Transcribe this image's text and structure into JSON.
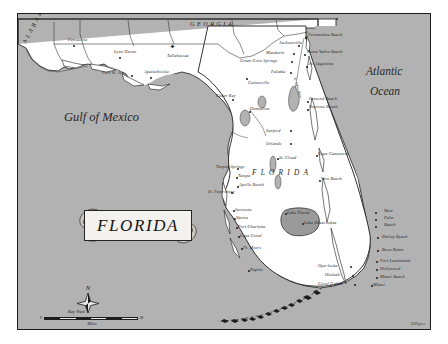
{
  "map": {
    "title": "FLORIDA",
    "frame": {
      "sea_color": "#b2b2b2",
      "land_color": "#ffffff",
      "ink_color": "#1b1b1b",
      "lake_color": "#9a9a9a"
    },
    "water_bodies": [
      {
        "name": "Gulf of Mexico",
        "x": 46,
        "y": 103
      },
      {
        "name": "Atlantic",
        "x": 348,
        "y": 58
      },
      {
        "name": "Ocean",
        "x": 352,
        "y": 78
      }
    ],
    "states": [
      {
        "name": "ALABAMA",
        "x": 13,
        "y": 22,
        "rotate": -62
      },
      {
        "name": "GEORGIA",
        "x": 172,
        "y": 7,
        "rotate": 0
      },
      {
        "name": "FLORIDA",
        "x": 236,
        "y": 157,
        "rotate": 0
      }
    ],
    "capital": {
      "name": "Tallahassee",
      "x": 154,
      "y": 38,
      "symbol": "star"
    },
    "river_label": {
      "name": "St. Johns River",
      "x": 298,
      "y": 73
    },
    "keys_label": {
      "name": "Key West",
      "x": 253,
      "y": 299
    },
    "credit": "DDFigures",
    "cities": [
      {
        "name": "Pensacola",
        "lx": 50,
        "ly": 24,
        "dx": 55,
        "dy": 31,
        "align": "left"
      },
      {
        "name": "Lynn Haven",
        "lx": 96,
        "ly": 36,
        "dx": 101,
        "dy": 43,
        "align": "left"
      },
      {
        "name": "Port St. Joe",
        "lx": 84,
        "ly": 57,
        "dx": 113,
        "dy": 61,
        "align": "left"
      },
      {
        "name": "Apalachicola",
        "lx": 126,
        "ly": 56,
        "dx": 132,
        "dy": 63,
        "align": "left"
      },
      {
        "name": "Cedar Key",
        "lx": 198,
        "ly": 80,
        "dx": 214,
        "dy": 85,
        "align": "left"
      },
      {
        "name": "Dunnellon",
        "lx": 232,
        "ly": 93,
        "dx": 231,
        "dy": 97,
        "align": "left"
      },
      {
        "name": "Gainesville",
        "lx": 230,
        "ly": 67,
        "dx": 228,
        "dy": 64,
        "align": "left"
      },
      {
        "name": "Palatka",
        "lx": 253,
        "ly": 56,
        "dx": 272,
        "dy": 58,
        "align": "left"
      },
      {
        "name": "Green Cove Springs",
        "lx": 222,
        "ly": 45,
        "dx": 273,
        "dy": 47,
        "align": "left"
      },
      {
        "name": "Mandarin",
        "lx": 248,
        "ly": 37,
        "dx": 275,
        "dy": 39,
        "align": "left"
      },
      {
        "name": "Jacksonville",
        "lx": 261,
        "ly": 27,
        "dx": 280,
        "dy": 31,
        "align": "left"
      },
      {
        "name": "Fernandina Beach",
        "lx": 290,
        "ly": 19,
        "dx": 287,
        "dy": 23,
        "align": "left"
      },
      {
        "name": "Ponte Vedra Beach",
        "lx": 289,
        "ly": 36,
        "dx": 286,
        "dy": 40,
        "align": "left"
      },
      {
        "name": "St. Augustine",
        "lx": 291,
        "ly": 48,
        "dx": 288,
        "dy": 52,
        "align": "left"
      },
      {
        "name": "Ormond Beach",
        "lx": 291,
        "ly": 83,
        "dx": 289,
        "dy": 87,
        "align": "left"
      },
      {
        "name": "Daytona Beach",
        "lx": 291,
        "ly": 91,
        "dx": 289,
        "dy": 95,
        "align": "left"
      },
      {
        "name": "Sanford",
        "lx": 248,
        "ly": 115,
        "dx": 272,
        "dy": 116,
        "align": "left"
      },
      {
        "name": "Orlando",
        "lx": 248,
        "ly": 128,
        "dx": 272,
        "dy": 129,
        "align": "left"
      },
      {
        "name": "St. Cloud",
        "lx": 261,
        "ly": 142,
        "dx": 259,
        "dy": 144,
        "align": "left"
      },
      {
        "name": "Cape Canaveral",
        "lx": 300,
        "ly": 138,
        "dx": 298,
        "dy": 141,
        "align": "left"
      },
      {
        "name": "Vero Beach",
        "lx": 303,
        "ly": 163,
        "dx": 301,
        "dy": 166,
        "align": "left"
      },
      {
        "name": "Tarpon Springs",
        "lx": 198,
        "ly": 151,
        "dx": 219,
        "dy": 154,
        "align": "left"
      },
      {
        "name": "Tampa",
        "lx": 220,
        "ly": 160,
        "dx": 218,
        "dy": 163,
        "align": "left"
      },
      {
        "name": "Apollo Beach",
        "lx": 221,
        "ly": 169,
        "dx": 219,
        "dy": 172,
        "align": "left"
      },
      {
        "name": "St. Petersburg",
        "lx": 190,
        "ly": 176,
        "dx": 213,
        "dy": 178,
        "align": "left"
      },
      {
        "name": "Sarasota",
        "lx": 217,
        "ly": 194,
        "dx": 215,
        "dy": 196,
        "align": "left"
      },
      {
        "name": "Venice",
        "lx": 218,
        "ly": 202,
        "dx": 216,
        "dy": 204,
        "align": "left"
      },
      {
        "name": "Port Charlotte",
        "lx": 220,
        "ly": 211,
        "dx": 218,
        "dy": 213,
        "align": "left"
      },
      {
        "name": "Cape Coral",
        "lx": 222,
        "ly": 220,
        "dx": 220,
        "dy": 222,
        "align": "left"
      },
      {
        "name": "Ft. Myers",
        "lx": 225,
        "ly": 232,
        "dx": 223,
        "dy": 234,
        "align": "left"
      },
      {
        "name": "Naples",
        "lx": 232,
        "ly": 254,
        "dx": 230,
        "dy": 256,
        "align": "left"
      },
      {
        "name": "Lake Placid",
        "lx": 269,
        "ly": 197,
        "dx": 267,
        "dy": 199,
        "align": "left"
      },
      {
        "name": "Lake Okeechobee",
        "lx": 286,
        "ly": 207,
        "dx": 284,
        "dy": 209,
        "align": "left"
      },
      {
        "name": "West",
        "lx": 366,
        "ly": 195,
        "dx": 357,
        "dy": 198,
        "align": "left"
      },
      {
        "name": "Palm",
        "lx": 366,
        "ly": 202,
        "dx": 357,
        "dy": 205,
        "align": "left"
      },
      {
        "name": "Beach",
        "lx": 366,
        "ly": 209,
        "dx": 357,
        "dy": 212,
        "align": "left"
      },
      {
        "name": "Delray Beach",
        "lx": 364,
        "ly": 221,
        "dx": 359,
        "dy": 223,
        "align": "left"
      },
      {
        "name": "Boca Raton",
        "lx": 364,
        "ly": 234,
        "dx": 359,
        "dy": 236,
        "align": "left"
      },
      {
        "name": "Fort Lauderdale",
        "lx": 362,
        "ly": 245,
        "dx": 358,
        "dy": 247,
        "align": "left"
      },
      {
        "name": "Hollywood",
        "lx": 362,
        "ly": 253,
        "dx": 358,
        "dy": 255,
        "align": "left"
      },
      {
        "name": "Miami Beach",
        "lx": 362,
        "ly": 261,
        "dx": 358,
        "dy": 263,
        "align": "left"
      },
      {
        "name": "Miami",
        "lx": 355,
        "ly": 269,
        "dx": 353,
        "dy": 271,
        "align": "left"
      },
      {
        "name": "Opa-locka",
        "lx": 300,
        "ly": 250,
        "dx": 332,
        "dy": 252,
        "align": "left"
      },
      {
        "name": "Hialeah",
        "lx": 307,
        "ly": 259,
        "dx": 334,
        "dy": 261,
        "align": "left"
      },
      {
        "name": "Coral Gables",
        "lx": 300,
        "ly": 268,
        "dx": 336,
        "dy": 270,
        "align": "left"
      }
    ],
    "compass": {
      "label": "N"
    },
    "scale": {
      "caption": "Miles",
      "start_label": "0",
      "end_label": "80",
      "segments": 6
    }
  }
}
